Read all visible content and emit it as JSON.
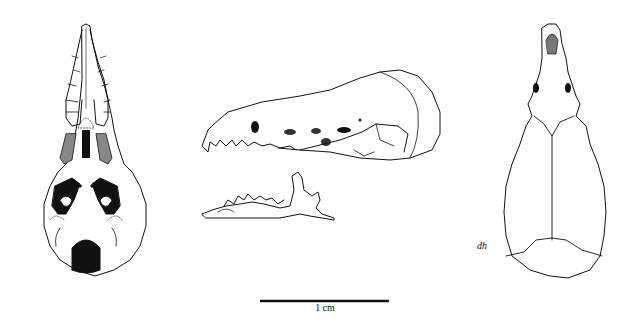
{
  "figure": {
    "views": [
      {
        "id": "ventral",
        "label": "Ventral view of skull"
      },
      {
        "id": "lateral",
        "label": "Lateral view of skull and mandible"
      },
      {
        "id": "dorsal",
        "label": "Dorsal view of skull"
      }
    ],
    "scale_bar": {
      "label": "1 cm"
    },
    "artist_signature": "dh",
    "colors": {
      "ink": "#111111",
      "background": "#ffffff"
    }
  }
}
